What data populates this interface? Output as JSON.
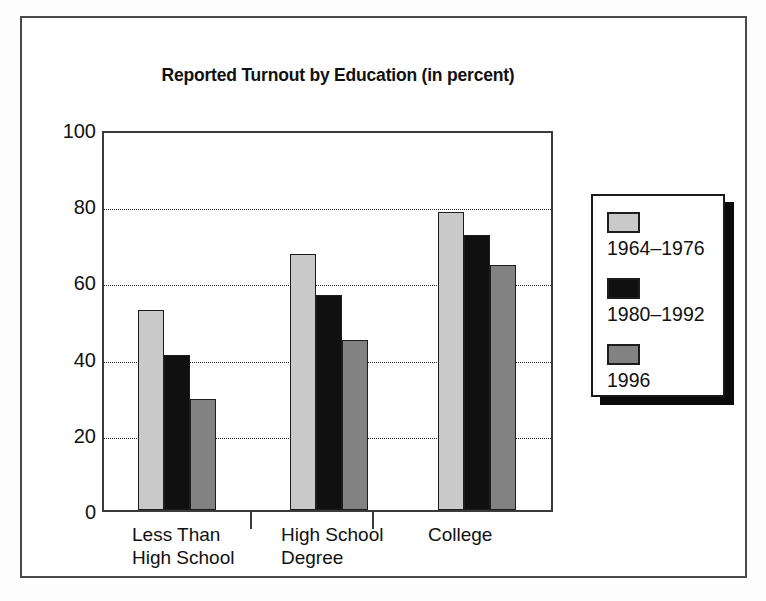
{
  "chart_data": {
    "type": "bar",
    "title": "Reported Turnout by Education (in percent)",
    "xlabel": "",
    "ylabel": "",
    "ylim": [
      0,
      100
    ],
    "yticks": [
      0,
      20,
      40,
      60,
      80,
      100
    ],
    "grid": "horizontal dotted at 20, 40, 60, 80",
    "legend_position": "right",
    "categories": [
      "Less Than\nHigh School",
      "High School\nDegree",
      "College"
    ],
    "series": [
      {
        "name": "1964–1976",
        "color": "#c9c9c9",
        "values": [
          53,
          68,
          79
        ]
      },
      {
        "name": "1980–1992",
        "color": "#101010",
        "values": [
          41,
          57,
          73
        ]
      },
      {
        "name": "1996",
        "color": "#828282",
        "values": [
          29.5,
          45,
          65
        ]
      }
    ]
  },
  "axis": {
    "y_tick_labels": [
      "100",
      "80",
      "60",
      "40",
      "20",
      "0"
    ]
  },
  "legend": {
    "entries": [
      {
        "label": "1964–1976",
        "swatch": "light-gray-swatch"
      },
      {
        "label": "1980–1992",
        "swatch": "black-swatch"
      },
      {
        "label": "1996",
        "swatch": "medium-gray-swatch"
      }
    ]
  },
  "colors": {
    "series_1964_1976": "#c9c9c9",
    "series_1980_1992": "#101010",
    "series_1996": "#828282",
    "frame": "#4a4a4a",
    "axis": "#3a3a3a",
    "text": "#111111",
    "background": "#ffffff"
  }
}
